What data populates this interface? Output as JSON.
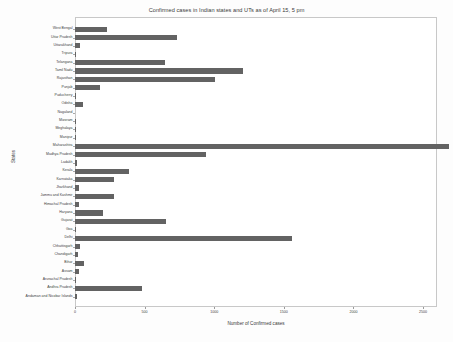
{
  "chart_data": {
    "type": "bar",
    "orientation": "horizontal",
    "title": "Confirmed cases in Indian states and UTs as of April 15, 5 pm",
    "xlabel": "Number of Confirmed cases",
    "ylabel": "States",
    "xlim": [
      0,
      2600
    ],
    "xticks": [
      0,
      500,
      1000,
      1500,
      2000,
      2500
    ],
    "xtick_labels": [
      "0",
      "500",
      "1000",
      "1500",
      "2000",
      "2500"
    ],
    "grid": false,
    "legend": null,
    "bar_color": "#636363",
    "categories": [
      "West Bengal",
      "Uttar Pradesh",
      "Uttarakhand",
      "Tripura",
      "Telangana",
      "Tamil Nadu",
      "Rajasthan",
      "Punjab",
      "Puducherry",
      "Odisha",
      "Nagaland",
      "Mizoram",
      "Meghalaya",
      "Manipur",
      "Maharashtra",
      "Madhya Pradesh",
      "Ladakh",
      "Kerala",
      "Karnataka",
      "Jharkhand",
      "Jammu and Kashmir",
      "Himachal Pradesh",
      "Haryana",
      "Gujarat",
      "Goa",
      "Delhi",
      "Chhattisgarh",
      "Chandigarh",
      "Bihar",
      "Assam",
      "Arunachal Pradesh",
      "Andhra Pradesh",
      "Andaman and Nicobar Islands"
    ],
    "values": [
      231,
      735,
      37,
      2,
      647,
      1204,
      1005,
      178,
      7,
      60,
      0,
      1,
      7,
      2,
      2687,
      938,
      17,
      386,
      279,
      27,
      278,
      32,
      199,
      650,
      7,
      1561,
      33,
      21,
      66,
      32,
      1,
      483,
      11
    ]
  }
}
